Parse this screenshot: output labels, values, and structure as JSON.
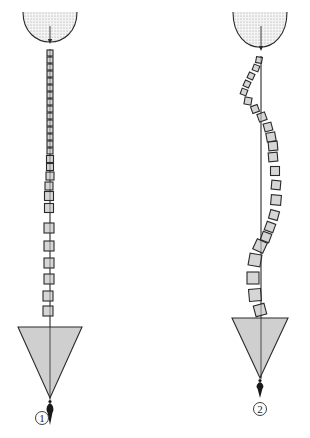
{
  "diagram": {
    "colors": {
      "ink": "#2a2a2a",
      "vertebra_fill": "#d6d6d6",
      "head_fill": "#e2e2e2",
      "pelvis_fill": "#cfcfcf",
      "plumb_bob": "#1a1a1a"
    },
    "figures": [
      {
        "id": "figure-1",
        "label": "1",
        "state": "straight spine aligned with plumb line",
        "plumb_x": 50,
        "head": {
          "cx": 50,
          "top": 12,
          "bottom": 48,
          "half_width": 27
        },
        "vertebrae": [
          {
            "x": 50,
            "y": 53,
            "s": 6,
            "r": 0
          },
          {
            "x": 50,
            "y": 60,
            "s": 6,
            "r": 0
          },
          {
            "x": 50,
            "y": 67,
            "s": 6,
            "r": 0
          },
          {
            "x": 50,
            "y": 74,
            "s": 6,
            "r": 0
          },
          {
            "x": 50,
            "y": 81,
            "s": 6,
            "r": 0
          },
          {
            "x": 50,
            "y": 88,
            "s": 6,
            "r": 0
          },
          {
            "x": 50,
            "y": 95,
            "s": 6,
            "r": 0
          },
          {
            "x": 50,
            "y": 102,
            "s": 6,
            "r": 0
          },
          {
            "x": 50,
            "y": 109,
            "s": 6,
            "r": 0
          },
          {
            "x": 50,
            "y": 116,
            "s": 6,
            "r": 0
          },
          {
            "x": 50,
            "y": 123,
            "s": 6,
            "r": 0
          },
          {
            "x": 50,
            "y": 130,
            "s": 6,
            "r": 0
          },
          {
            "x": 50,
            "y": 137,
            "s": 6,
            "r": 0
          },
          {
            "x": 50,
            "y": 144,
            "s": 6,
            "r": 0
          },
          {
            "x": 50,
            "y": 151,
            "s": 6,
            "r": 0
          },
          {
            "x": 50,
            "y": 159,
            "s": 7,
            "r": 0
          },
          {
            "x": 50,
            "y": 167,
            "s": 7,
            "r": 0
          },
          {
            "x": 50,
            "y": 176,
            "s": 8,
            "r": 0
          },
          {
            "x": 49,
            "y": 186,
            "s": 8,
            "r": 0
          },
          {
            "x": 49,
            "y": 196,
            "s": 9,
            "r": 0
          },
          {
            "x": 49,
            "y": 208,
            "s": 9,
            "r": 0
          },
          {
            "x": 49,
            "y": 228,
            "s": 10,
            "r": 0
          },
          {
            "x": 49,
            "y": 246,
            "s": 10,
            "r": 0
          },
          {
            "x": 49,
            "y": 263,
            "s": 10,
            "r": 0
          },
          {
            "x": 49,
            "y": 279,
            "s": 10,
            "r": 0
          },
          {
            "x": 48,
            "y": 296,
            "s": 10,
            "r": 0
          },
          {
            "x": 48,
            "y": 311,
            "s": 10,
            "r": 0
          }
        ],
        "pelvis": {
          "left": 18,
          "right": 82,
          "top": 327,
          "apex_y": 398,
          "apex_x": 50
        },
        "bob": {
          "x": 50,
          "top": 400,
          "bottom": 425
        },
        "label_pos": {
          "x": 42,
          "y": 418
        }
      },
      {
        "id": "figure-2",
        "label": "2",
        "state": "curved (scoliotic) spine deviating from plumb line",
        "plumb_x": 261,
        "head": {
          "cx": 260,
          "top": 12,
          "bottom": 55,
          "half_width": 27
        },
        "vertebrae": [
          {
            "x": 259,
            "y": 60,
            "s": 6,
            "r": 10
          },
          {
            "x": 256,
            "y": 68,
            "s": 6,
            "r": 20
          },
          {
            "x": 251,
            "y": 76,
            "s": 6,
            "r": 25
          },
          {
            "x": 247,
            "y": 84,
            "s": 6,
            "r": 25
          },
          {
            "x": 244,
            "y": 92,
            "s": 6,
            "r": 20
          },
          {
            "x": 248,
            "y": 101,
            "s": 7,
            "r": 10
          },
          {
            "x": 255,
            "y": 109,
            "s": 7,
            "r": -20
          },
          {
            "x": 262,
            "y": 117,
            "s": 8,
            "r": -20
          },
          {
            "x": 268,
            "y": 127,
            "s": 8,
            "r": -15
          },
          {
            "x": 271,
            "y": 137,
            "s": 9,
            "r": -10
          },
          {
            "x": 273,
            "y": 146,
            "s": 9,
            "r": -5
          },
          {
            "x": 273,
            "y": 157,
            "s": 9,
            "r": -5
          },
          {
            "x": 275,
            "y": 171,
            "s": 9,
            "r": 0
          },
          {
            "x": 276,
            "y": 185,
            "s": 9,
            "r": 5
          },
          {
            "x": 276,
            "y": 200,
            "s": 10,
            "r": 5
          },
          {
            "x": 274,
            "y": 215,
            "s": 9,
            "r": 15
          },
          {
            "x": 270,
            "y": 227,
            "s": 9,
            "r": 20
          },
          {
            "x": 266,
            "y": 237,
            "s": 9,
            "r": 20
          },
          {
            "x": 260,
            "y": 246,
            "s": 11,
            "r": 25
          },
          {
            "x": 255,
            "y": 260,
            "s": 12,
            "r": 10
          },
          {
            "x": 253,
            "y": 278,
            "s": 12,
            "r": 0
          },
          {
            "x": 255,
            "y": 295,
            "s": 12,
            "r": -5
          },
          {
            "x": 260,
            "y": 310,
            "s": 11,
            "r": -15
          }
        ],
        "pelvis": {
          "left": 232,
          "right": 288,
          "top": 318,
          "apex_y": 378,
          "apex_x": 260
        },
        "bob": {
          "x": 260,
          "top": 379,
          "bottom": 398
        },
        "label_pos": {
          "x": 260,
          "y": 409
        }
      }
    ]
  }
}
